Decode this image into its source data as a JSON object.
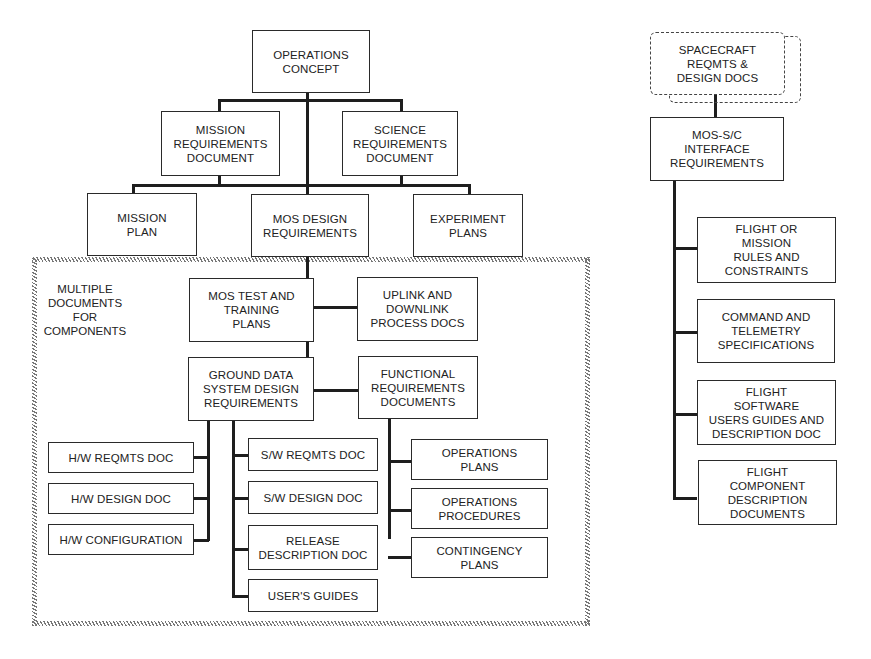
{
  "diagram": {
    "title": "",
    "nodes": {
      "operations_concept": "OPERATIONS\nCONCEPT",
      "mission_requirements": "MISSION\nREQUIREMENTS\nDOCUMENT",
      "science_requirements": "SCIENCE\nREQUIREMENTS\nDOCUMENT",
      "mission_plan": "MISSION\nPLAN",
      "mos_design_requirements": "MOS DESIGN\nREQUIREMENTS",
      "experiment_plans": "EXPERIMENT\nPLANS",
      "mos_test_training": "MOS TEST AND\nTRAINING\nPLANS",
      "uplink_downlink": "UPLINK AND\nDOWNLINK\nPROCESS DOCS",
      "gds_design_requirements": "GROUND DATA\nSYSTEM DESIGN\nREQUIREMENTS",
      "functional_requirements": "FUNCTIONAL\nREQUIREMENTS\nDOCUMENTS",
      "hw_reqmts": "H/W REQMTS DOC",
      "hw_design": "H/W DESIGN DOC",
      "hw_configuration": "H/W CONFIGURATION",
      "sw_reqmts": "S/W REQMTS DOC",
      "sw_design": "S/W DESIGN DOC",
      "release_description": "RELEASE\nDESCRIPTION DOC",
      "users_guides": "USER'S GUIDES",
      "operations_plans": "OPERATIONS\nPLANS",
      "operations_procedures": "OPERATIONS\nPROCEDURES",
      "contingency_plans": "CONTINGENCY\nPLANS",
      "spacecraft_reqmts": "SPACECRAFT\nREQMTS &\nDESIGN DOCS",
      "mos_sc_interface": "MOS-S/C\nINTERFACE\nREQUIREMENTS",
      "flight_mission_rules": "FLIGHT OR\nMISSION\nRULES AND\nCONSTRAINTS",
      "command_telemetry": "COMMAND AND\nTELEMETRY\nSPECIFICATIONS",
      "flight_software_guides": "FLIGHT\nSOFTWARE\nUSERS GUIDES AND\nDESCRIPTION DOC",
      "flight_component_docs": "FLIGHT\nCOMPONENT\nDESCRIPTION\nDOCUMENTS"
    },
    "group_label": "MULTIPLE\nDOCUMENTS\nFOR\nCOMPONENTS",
    "colors": {
      "line": "#1e1e1e",
      "box_border": "#2a2a2a",
      "hatch": "#777777",
      "background": "#ffffff"
    }
  }
}
